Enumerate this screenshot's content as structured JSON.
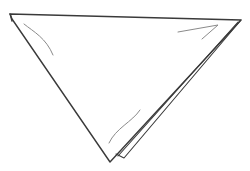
{
  "drawing": {
    "subject": "folded triangle napkin line drawing",
    "stroke_color": "#3a3a3a",
    "crease_color": "#8a8a8a",
    "background_color": "#ffffff"
  }
}
